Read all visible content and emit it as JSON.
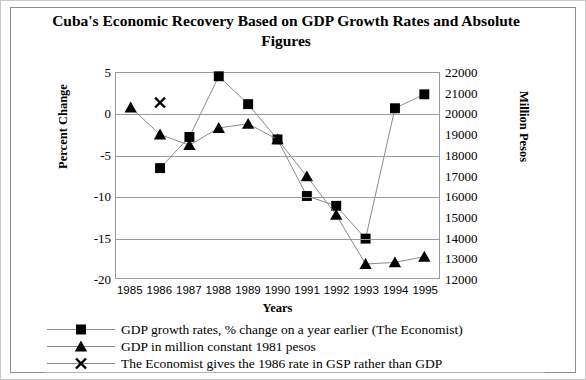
{
  "chart_data": {
    "type": "line",
    "title": "Cuba's Economic Recovery Based on GDP Growth Rates and Absolute Figures",
    "xlabel": "Years",
    "ylabel": "Percent Change",
    "ylabel_right": "Million Pesos",
    "categories": [
      "1985",
      "1986",
      "1987",
      "1988",
      "1989",
      "1990",
      "1991",
      "1992",
      "1993",
      "1994",
      "1995"
    ],
    "x": [
      1985,
      1986,
      1987,
      1988,
      1989,
      1990,
      1991,
      1992,
      1993,
      1994,
      1995
    ],
    "ylim": [
      -20,
      5
    ],
    "yticks": [
      5,
      0,
      -5,
      -10,
      -15,
      -20
    ],
    "ylim_right": [
      12000,
      22000
    ],
    "yticks_right": [
      22000,
      21000,
      20000,
      19000,
      18000,
      17000,
      16000,
      15000,
      14000,
      13000,
      12000
    ],
    "grid": true,
    "legend_position": "below",
    "series": [
      {
        "name": "GDP growth rates, % change on a year earlier (The Economist)",
        "marker": "square",
        "axis": "left",
        "x": [
          1986,
          1987,
          1988,
          1989,
          1990,
          1991,
          1992,
          1993,
          1994,
          1995
        ],
        "values": [
          -6.6,
          -2.8,
          4.6,
          1.2,
          -3.1,
          -10.0,
          -11.2,
          -15.2,
          0.7,
          2.4
        ]
      },
      {
        "name": "GDP in million constant 1981 pesos",
        "marker": "triangle",
        "axis": "right",
        "x": [
          1985,
          1986,
          1987,
          1988,
          1989,
          1990,
          1991,
          1992,
          1993,
          1994,
          1995
        ],
        "values": [
          20350,
          19000,
          18480,
          19320,
          19550,
          18750,
          16700,
          15000,
          12850,
          12900,
          13100
        ],
        "values_left_scale": [
          0.8,
          -2.5,
          -3.8,
          -1.7,
          -1.2,
          -3.1,
          -7.6,
          -12.3,
          -18.3,
          -18.1,
          -17.4
        ]
      },
      {
        "name": "The Economist gives the 1986 rate in GSP rather than GDP",
        "marker": "cross",
        "axis": "left",
        "x": [
          1986
        ],
        "values": [
          1.4
        ]
      }
    ],
    "annotations": []
  },
  "legend": {
    "items": [
      {
        "marker": "square-marker",
        "label": "GDP growth rates, % change on a year earlier (The Economist)"
      },
      {
        "marker": "triangle-marker",
        "label": "GDP in million constant 1981 pesos"
      },
      {
        "marker": "cross-marker",
        "label": "The Economist gives the 1986 rate in GSP rather than GDP"
      }
    ]
  },
  "colors": {
    "series": "#000000",
    "line": "#8a8a8a",
    "grid": "#9a9a9a",
    "frame": "#9a9a9a",
    "outer_border": "#c9c9c9",
    "background": "#ffffff"
  }
}
